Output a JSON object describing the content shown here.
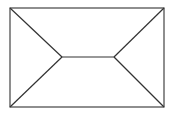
{
  "diagram": {
    "type": "line-drawing",
    "stroke_color": "#333333",
    "background": "#ffffff",
    "rectangle": {
      "x1": 10,
      "y1": 8,
      "x2": 164,
      "y2": 107
    },
    "center_segment": {
      "x1": 62,
      "y1": 57,
      "x2": 114,
      "y2": 57
    },
    "lines": [
      {
        "from": [
          10,
          8
        ],
        "to": [
          62,
          57
        ]
      },
      {
        "from": [
          10,
          107
        ],
        "to": [
          62,
          57
        ]
      },
      {
        "from": [
          164,
          8
        ],
        "to": [
          114,
          57
        ]
      },
      {
        "from": [
          164,
          107
        ],
        "to": [
          114,
          57
        ]
      },
      {
        "from": [
          62,
          57
        ],
        "to": [
          114,
          57
        ]
      }
    ]
  }
}
